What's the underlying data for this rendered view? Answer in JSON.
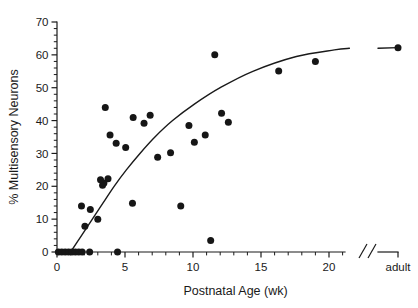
{
  "chart_data": {
    "type": "scatter",
    "title": "",
    "xlabel": "Postnatal Age (wk)",
    "ylabel": "% Multisensory Neurons",
    "xlim": [
      0,
      23
    ],
    "ylim": [
      0,
      70
    ],
    "grid": false,
    "legend": null,
    "x_axis": {
      "major_ticks": [
        0,
        5,
        10,
        15,
        20
      ],
      "major_tick_labels": [
        "0",
        "5",
        "10",
        "15",
        "20"
      ],
      "minor_tick_step": 1,
      "axis_break": true,
      "axis_break_label": "//",
      "terminal_tick_label": "adult",
      "terminal_tick_value": 23
    },
    "y_axis": {
      "major_ticks": [
        0,
        10,
        20,
        30,
        40,
        50,
        60,
        70
      ],
      "major_tick_labels": [
        "0",
        "10",
        "20",
        "30",
        "40",
        "50",
        "60",
        "70"
      ],
      "minor_tick_step": 2
    },
    "points": [
      {
        "x": 0.1,
        "y": 0
      },
      {
        "x": 0.35,
        "y": 0
      },
      {
        "x": 0.6,
        "y": 0
      },
      {
        "x": 0.85,
        "y": 0
      },
      {
        "x": 1.1,
        "y": 0
      },
      {
        "x": 1.35,
        "y": 0
      },
      {
        "x": 1.6,
        "y": 0
      },
      {
        "x": 1.85,
        "y": 0
      },
      {
        "x": 2.4,
        "y": 0
      },
      {
        "x": 4.45,
        "y": 0
      },
      {
        "x": 11.3,
        "y": 3.5
      },
      {
        "x": 2.05,
        "y": 7.8
      },
      {
        "x": 3.0,
        "y": 10.0
      },
      {
        "x": 2.45,
        "y": 12.9
      },
      {
        "x": 1.8,
        "y": 14.0
      },
      {
        "x": 5.55,
        "y": 14.8
      },
      {
        "x": 9.1,
        "y": 14.0
      },
      {
        "x": 3.35,
        "y": 20.3
      },
      {
        "x": 3.45,
        "y": 21.0
      },
      {
        "x": 3.2,
        "y": 22.0
      },
      {
        "x": 3.75,
        "y": 22.3
      },
      {
        "x": 7.4,
        "y": 28.8
      },
      {
        "x": 8.35,
        "y": 30.2
      },
      {
        "x": 5.05,
        "y": 31.8
      },
      {
        "x": 10.1,
        "y": 33.4
      },
      {
        "x": 4.35,
        "y": 33.1
      },
      {
        "x": 3.9,
        "y": 35.6
      },
      {
        "x": 10.9,
        "y": 35.6
      },
      {
        "x": 12.6,
        "y": 39.5
      },
      {
        "x": 6.4,
        "y": 39.2
      },
      {
        "x": 9.7,
        "y": 38.5
      },
      {
        "x": 5.6,
        "y": 40.9
      },
      {
        "x": 6.85,
        "y": 41.6
      },
      {
        "x": 12.1,
        "y": 42.2
      },
      {
        "x": 3.55,
        "y": 44.0
      },
      {
        "x": 11.6,
        "y": 60.0
      },
      {
        "x": 16.3,
        "y": 55.1
      },
      {
        "x": 19.0,
        "y": 58.0
      },
      {
        "x": 23.0,
        "y": 62.2
      }
    ],
    "fit_curve": {
      "description": "sigmoid-like fitted trend line rising from 0% near 1 wk to a plateau near 62% at adult",
      "points": [
        {
          "x": 1.0,
          "y": 0.0
        },
        {
          "x": 1.8,
          "y": 5.0
        },
        {
          "x": 2.6,
          "y": 10.0
        },
        {
          "x": 3.4,
          "y": 15.0
        },
        {
          "x": 4.2,
          "y": 20.0
        },
        {
          "x": 5.1,
          "y": 25.0
        },
        {
          "x": 6.1,
          "y": 30.0
        },
        {
          "x": 7.2,
          "y": 35.0
        },
        {
          "x": 8.5,
          "y": 40.0
        },
        {
          "x": 10.1,
          "y": 45.0
        },
        {
          "x": 12.0,
          "y": 50.0
        },
        {
          "x": 14.4,
          "y": 55.0
        },
        {
          "x": 17.6,
          "y": 59.5
        },
        {
          "x": 20.4,
          "y": 61.5
        },
        {
          "x": 21.5,
          "y": 62.0
        },
        {
          "x": 23.0,
          "y": 62.2
        }
      ]
    }
  }
}
